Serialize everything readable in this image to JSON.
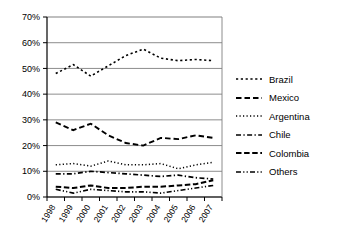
{
  "chart_data": {
    "type": "line",
    "title": "",
    "xlabel": "",
    "ylabel": "",
    "categories": [
      "1998",
      "1999",
      "2000",
      "2001",
      "2002",
      "2003",
      "2004",
      "2005",
      "2006",
      "2007"
    ],
    "ylim": [
      0,
      70
    ],
    "ytick_labels": [
      "0%",
      "10%",
      "20%",
      "30%",
      "40%",
      "50%",
      "60%",
      "70%"
    ],
    "ytick_values": [
      0,
      10,
      20,
      30,
      40,
      50,
      60,
      70
    ],
    "grid": "horizontal",
    "legend_position": "right",
    "series": [
      {
        "name": "Brazil",
        "style": "fine-dotted",
        "values": [
          48,
          51.5,
          47,
          51,
          55,
          57.5,
          54,
          53,
          53.5,
          53
        ]
      },
      {
        "name": "Mexico",
        "style": "dashed",
        "values": [
          29,
          26,
          28.5,
          24,
          21,
          20,
          23,
          22.5,
          24,
          23
        ]
      },
      {
        "name": "Argentina",
        "style": "dotted",
        "values": [
          12.5,
          13,
          12,
          14,
          12.5,
          12.5,
          13,
          11,
          12.5,
          13.5
        ]
      },
      {
        "name": "Chile",
        "style": "dash-dot",
        "values": [
          9,
          9,
          10,
          9.5,
          9,
          8.5,
          8,
          8.5,
          7.5,
          7
        ]
      },
      {
        "name": "Colombia",
        "style": "dashed-thick",
        "values": [
          4,
          3.5,
          4.5,
          3.5,
          3.5,
          4,
          4,
          4.5,
          5,
          6.5
        ]
      },
      {
        "name": "Others",
        "style": "dash-dot-dot",
        "values": [
          3,
          1.5,
          3,
          2.5,
          2,
          2,
          1.5,
          2.5,
          3.5,
          4.5
        ]
      }
    ]
  },
  "legend": {
    "items": [
      {
        "label": "Brazil"
      },
      {
        "label": "Mexico"
      },
      {
        "label": "Argentina"
      },
      {
        "label": "Chile"
      },
      {
        "label": "Colombia"
      },
      {
        "label": "Others"
      }
    ]
  },
  "colors": {
    "line": "#000000",
    "grid": "#808080",
    "axis": "#000000",
    "background": "#ffffff"
  }
}
